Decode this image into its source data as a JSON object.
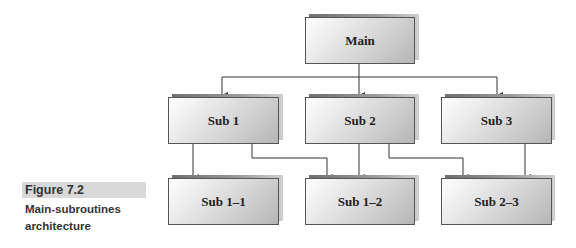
{
  "figure": {
    "label": "Figure 7.2",
    "caption_line1": "Main-subroutines",
    "caption_line2": "architecture",
    "caption_bar_color": "#d9d9d9"
  },
  "nodes": {
    "main": "Main",
    "sub1": "Sub 1",
    "sub2": "Sub 2",
    "sub3": "Sub 3",
    "sub1_1": "Sub 1–1",
    "sub1_2": "Sub 1–2",
    "sub2_3": "Sub 2–3"
  },
  "edges": [
    [
      "Main",
      "Sub 1"
    ],
    [
      "Main",
      "Sub 2"
    ],
    [
      "Main",
      "Sub 3"
    ],
    [
      "Sub 1",
      "Sub 1–1"
    ],
    [
      "Sub 1",
      "Sub 1–2"
    ],
    [
      "Sub 2",
      "Sub 1–2"
    ],
    [
      "Sub 2",
      "Sub 2–3"
    ],
    [
      "Sub 3",
      "Sub 2–3"
    ]
  ]
}
